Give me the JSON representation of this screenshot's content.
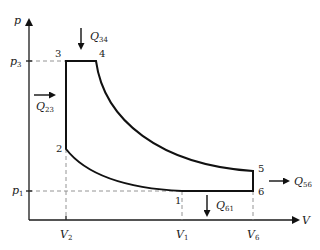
{
  "diagram": {
    "axes": {
      "y_label": "p",
      "x_label": "V"
    },
    "pressure_ticks": [
      {
        "base": "p",
        "sub": "3"
      },
      {
        "base": "p",
        "sub": "1"
      }
    ],
    "volume_ticks": [
      {
        "base": "V",
        "sub": "2"
      },
      {
        "base": "V",
        "sub": "1"
      },
      {
        "base": "V",
        "sub": "6"
      }
    ],
    "states": [
      "1",
      "2",
      "3",
      "4",
      "5",
      "6"
    ],
    "heat_flows": [
      {
        "id": "Q34",
        "base": "Q",
        "sub": "34",
        "direction": "in"
      },
      {
        "id": "Q23",
        "base": "Q",
        "sub": "23",
        "direction": "in"
      },
      {
        "id": "Q56",
        "base": "Q",
        "sub": "56",
        "direction": "out"
      },
      {
        "id": "Q61",
        "base": "Q",
        "sub": "61",
        "direction": "out"
      }
    ],
    "colors": {
      "line": "#111111",
      "dashed": "#888888",
      "background": "#ffffff"
    }
  }
}
